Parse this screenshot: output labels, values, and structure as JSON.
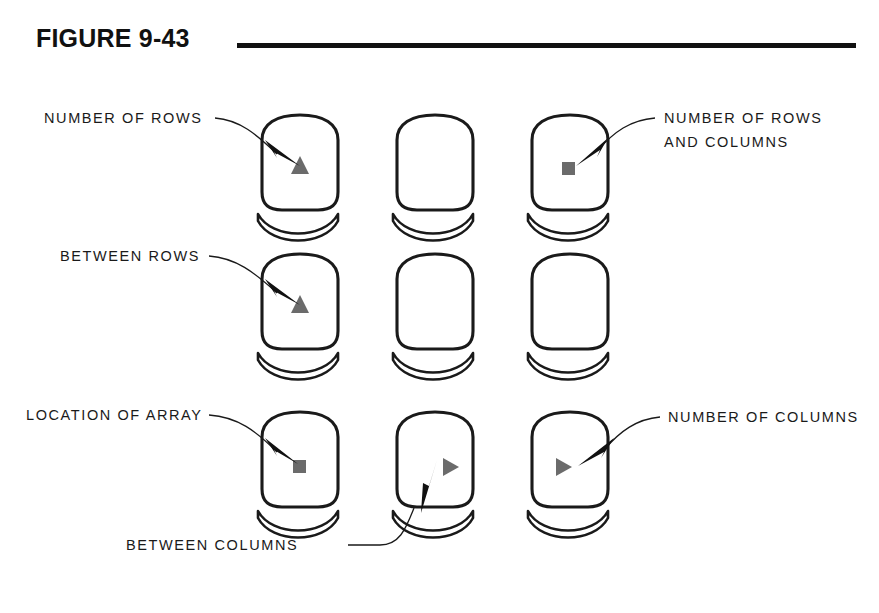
{
  "figure": {
    "title": "FIGURE 9-43",
    "rule_color": "#111111"
  },
  "diagram": {
    "type": "annotated-seat-array",
    "background": "#ffffff",
    "line_color": "#1a1a1a",
    "marker_color": "#6b6b6b",
    "arrow_color": "#111111",
    "grid": {
      "rows": 3,
      "columns": 3,
      "column_centers": [
        300,
        435,
        570
      ],
      "row_centers": [
        103,
        242,
        400
      ]
    },
    "seats": [
      {
        "id": "seat-r1c1",
        "row": 1,
        "column": 1,
        "marker": "triangle-up"
      },
      {
        "id": "seat-r1c2",
        "row": 1,
        "column": 2,
        "marker": "none"
      },
      {
        "id": "seat-r1c3",
        "row": 1,
        "column": 3,
        "marker": "square"
      },
      {
        "id": "seat-r2c1",
        "row": 2,
        "column": 1,
        "marker": "triangle-up"
      },
      {
        "id": "seat-r2c2",
        "row": 2,
        "column": 2,
        "marker": "none"
      },
      {
        "id": "seat-r2c3",
        "row": 2,
        "column": 3,
        "marker": "none"
      },
      {
        "id": "seat-r3c1",
        "row": 3,
        "column": 1,
        "marker": "square"
      },
      {
        "id": "seat-r3c2",
        "row": 3,
        "column": 2,
        "marker": "triangle-right"
      },
      {
        "id": "seat-r3c3",
        "row": 3,
        "column": 3,
        "marker": "triangle-right"
      }
    ],
    "callouts": [
      {
        "id": "callout-number-of-rows",
        "lines": [
          "NUMBER OF ROWS"
        ],
        "target_seat": "seat-r1c1",
        "side": "left"
      },
      {
        "id": "callout-number-of-rows-and-columns",
        "lines": [
          "NUMBER OF ROWS",
          "AND COLUMNS"
        ],
        "target_seat": "seat-r1c3",
        "side": "right"
      },
      {
        "id": "callout-between-rows",
        "lines": [
          "BETWEEN ROWS"
        ],
        "target_seat": "seat-r2c1",
        "side": "left"
      },
      {
        "id": "callout-location-of-array",
        "lines": [
          "LOCATION OF ARRAY"
        ],
        "target_seat": "seat-r3c1",
        "side": "left"
      },
      {
        "id": "callout-number-of-columns",
        "lines": [
          "NUMBER OF COLUMNS"
        ],
        "target_seat": "seat-r3c3",
        "side": "right"
      },
      {
        "id": "callout-between-columns",
        "lines": [
          "BETWEEN COLUMNS"
        ],
        "target_seat": "seat-r3c2",
        "side": "bottom"
      }
    ],
    "labels": {
      "number_of_rows": "NUMBER OF ROWS",
      "number_of_rows_and_columns_l1": "NUMBER OF ROWS",
      "number_of_rows_and_columns_l2": "AND COLUMNS",
      "between_rows": "BETWEEN ROWS",
      "location_of_array": "LOCATION OF ARRAY",
      "number_of_columns": "NUMBER OF COLUMNS",
      "between_columns": "BETWEEN COLUMNS"
    }
  }
}
